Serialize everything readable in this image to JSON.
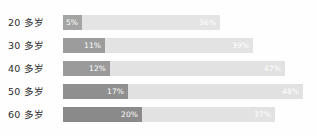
{
  "chart_data": {
    "type": "bar",
    "title": "",
    "subtitle": "",
    "xlabel": "",
    "ylabel": "",
    "orientation": "horizontal",
    "stacked": true,
    "grid": false,
    "legend": "none",
    "xlim": [
      0,
      70
    ],
    "categories": [
      "20 多岁",
      "30 多岁",
      "40 多岁",
      "50 多岁",
      "60 多岁"
    ],
    "series": [
      {
        "name": "dark-segment",
        "color": "#9b9b9b",
        "values": [
          5,
          11,
          12,
          17,
          20
        ],
        "labels": [
          "5%",
          "11%",
          "12%",
          "17%",
          "20%"
        ]
      },
      {
        "name": "light-segment",
        "color": "#e3e3e3",
        "values": [
          36,
          39,
          47,
          48,
          37
        ],
        "labels": [
          "36%",
          "39%",
          "47%",
          "48%",
          "37%"
        ]
      }
    ]
  },
  "rows": [
    {
      "label": "20 多岁",
      "dark": {
        "label": "5%",
        "width_px": 19,
        "color": "#a4a4a4"
      },
      "light": {
        "label": "36%",
        "width_px": 138,
        "color": "#e4e4e4"
      }
    },
    {
      "label": "30 多岁",
      "dark": {
        "label": "11%",
        "width_px": 42,
        "color": "#9c9c9c"
      },
      "light": {
        "label": "39%",
        "width_px": 148,
        "color": "#e3e3e3"
      }
    },
    {
      "label": "40 多岁",
      "dark": {
        "label": "12%",
        "width_px": 47,
        "color": "#9a9a9a"
      },
      "light": {
        "label": "47%",
        "width_px": 175,
        "color": "#e2e2e2"
      }
    },
    {
      "label": "50 多岁",
      "dark": {
        "label": "17%",
        "width_px": 65,
        "color": "#8f8f8f"
      },
      "light": {
        "label": "48%",
        "width_px": 175,
        "color": "#e1e1e1"
      }
    },
    {
      "label": "60 多岁",
      "dark": {
        "label": "20%",
        "width_px": 79,
        "color": "#8a8a8a"
      },
      "light": {
        "label": "37%",
        "width_px": 133,
        "color": "#e2e2e2"
      }
    }
  ]
}
